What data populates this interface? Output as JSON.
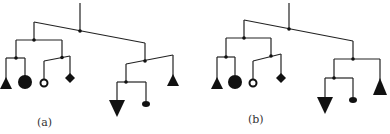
{
  "figure": {
    "panels": [
      {
        "label": "(a)",
        "description": "mobile balanced tree, left subtree tilted"
      },
      {
        "label": "(b)",
        "description": "mobile balanced tree, right subtree level"
      }
    ],
    "colors": {
      "stroke": "#222222",
      "fill": "#111111",
      "background": "#ffffff"
    },
    "leaves": [
      "filled-triangle",
      "filled-circle",
      "hollow-circle",
      "diamond",
      "inverted-triangle",
      "small-disc",
      "filled-triangle"
    ]
  }
}
